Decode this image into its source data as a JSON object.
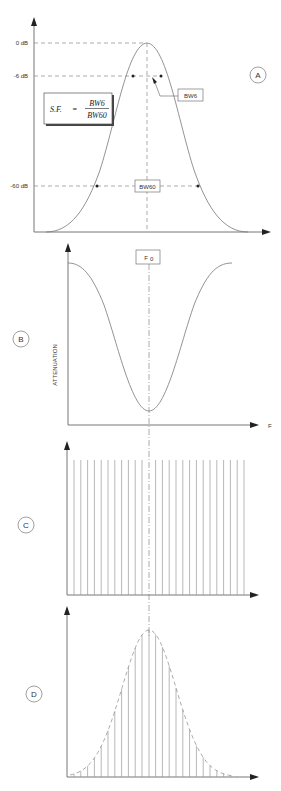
{
  "panels": {
    "a": {
      "label": "A",
      "y_ticks": [
        "0 dB",
        "-6 dB",
        "-60 dB"
      ],
      "formula": {
        "lhs": "S.F.",
        "eq": "=",
        "numerator": "BW6",
        "denominator": "BW60"
      },
      "bw6_label": "BW6",
      "bw60_label": "BW60"
    },
    "b": {
      "label": "B",
      "center_label": "F",
      "center_sub": "0",
      "ylabel": "ATTENUATION",
      "xlabel": "F"
    },
    "c": {
      "label": "C"
    },
    "d": {
      "label": "D"
    }
  },
  "colors": {
    "line": "#777777",
    "text": "#333333",
    "background": "#ffffff"
  },
  "chart_data": [
    {
      "type": "line",
      "title": "A - Filter passband response",
      "ylabel": "Level (dB)",
      "y_ticks": [
        "0 dB",
        "-6 dB",
        "-60 dB"
      ],
      "annotations": [
        "S.F. = BW6 / BW60",
        "BW6",
        "BW60"
      ],
      "shape": "bell curve peaking at center frequency"
    },
    {
      "type": "line",
      "title": "B - Attenuation vs frequency",
      "ylabel": "ATTENUATION",
      "xlabel": "F",
      "annotations": [
        "F0"
      ],
      "shape": "inverted bell with minimum at F0"
    },
    {
      "type": "bar",
      "title": "C - Uniform spectral lines",
      "bars": 26,
      "values": "equal height"
    },
    {
      "type": "bar",
      "title": "D - Spectral lines weighted by filter response",
      "bars": 26,
      "envelope": "dashed bell curve peaking at F0"
    }
  ]
}
